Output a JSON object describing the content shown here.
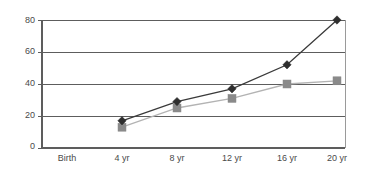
{
  "chart_data": {
    "type": "line",
    "title": "",
    "xlabel": "",
    "ylabel": "",
    "categories": [
      "Birth",
      "4 yr",
      "8 yr",
      "12 yr",
      "16 yr",
      "20 yr"
    ],
    "ylim": [
      0,
      80
    ],
    "yticks": [
      0,
      20,
      40,
      60,
      80
    ],
    "ytick_labels": [
      "0",
      "20",
      "40",
      "60",
      "80"
    ],
    "grid": "horizontal",
    "legend": "none",
    "series": [
      {
        "name": "dark-diamond-series",
        "marker": "diamond",
        "color": "#2e2e2e",
        "line_color": "#3a3a3a",
        "x": [
          "4 yr",
          "8 yr",
          "12 yr",
          "16 yr",
          "20 yr"
        ],
        "values": [
          17,
          29,
          37,
          52,
          80
        ]
      },
      {
        "name": "light-square-series",
        "marker": "square",
        "color": "#8a8a8a",
        "line_color": "#b3b3b3",
        "x": [
          "4 yr",
          "8 yr",
          "12 yr",
          "16 yr",
          "20 yr"
        ],
        "values": [
          13,
          25,
          31,
          40,
          42
        ]
      }
    ]
  },
  "axis": {
    "y_labels": [
      "80",
      "60",
      "40",
      "20",
      "0"
    ],
    "x_labels": [
      "Birth",
      "4 yr",
      "8 yr",
      "12 yr",
      "16 yr",
      "20 yr"
    ]
  },
  "colors": {
    "background": "#ffffff",
    "axis": "#5d5d5d",
    "grid": "#5d5d5d",
    "frame": "#9a9a9a",
    "series_dark": "#3a3a3a",
    "series_light": "#b3b3b3",
    "marker_dark": "#2e2e2e",
    "marker_light": "#8a8a8a",
    "label_text": "#4a4a4a"
  }
}
